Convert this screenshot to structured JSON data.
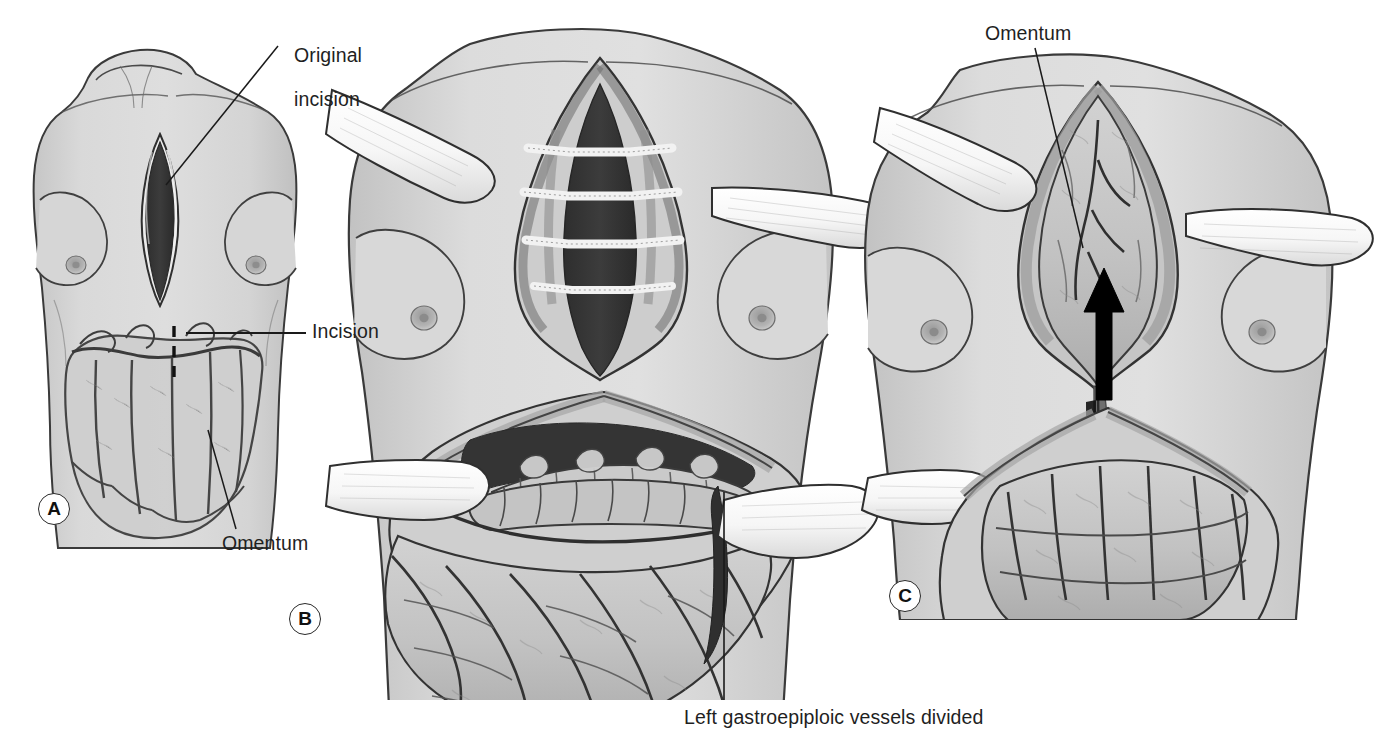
{
  "figure": {
    "title_hidden": "",
    "style": "grayscale medical line-and-wash illustration",
    "background_color": "#ffffff",
    "ink_color": "#2a2a2a",
    "skin_fill": "#d8d8d8",
    "skin_shadow": "#bdbdbd",
    "wound_dark": "#3a3a3a",
    "wound_darkest": "#2f2f2f",
    "tissue_fill": "#c9c9c9",
    "tissue_mid": "#b5b5b5",
    "retractor_fill": "#fbfbfb",
    "retractor_edge": "#3a3a3a",
    "arrow_color": "#000000"
  },
  "panels": [
    {
      "id": "A",
      "marker": "A",
      "marker_pos": {
        "x": 38,
        "y": 493
      },
      "description": "Frontal female torso with median sternotomy incision open; ghosted omentum overlaid on the upper abdomen; dashed vertical line marks planned incision."
    },
    {
      "id": "B",
      "marker": "B",
      "marker_pos": {
        "x": 289,
        "y": 603
      },
      "description": "Torso with sternal wound retracted showing sternal wires, and upper abdomen opened with retractors exposing transverse colon, stomach and omentum."
    },
    {
      "id": "C",
      "marker": "C",
      "marker_pos": {
        "x": 889,
        "y": 580
      },
      "description": "Omentum passed through a substernal tunnel into the sternal wound; black arrow indicates direction of transposition."
    }
  ],
  "labels": [
    {
      "key": "original_incision",
      "text": "Original\nincision",
      "text_lines": [
        "Original",
        "incision"
      ],
      "pos": {
        "x": 283,
        "y": 26
      },
      "leader": {
        "x1": 278,
        "y1": 46,
        "x2": 166,
        "y2": 185
      },
      "panel": "A"
    },
    {
      "key": "incision",
      "text": "Incision",
      "text_lines": [
        "Incision"
      ],
      "pos": {
        "x": 312,
        "y": 322
      },
      "leader": {
        "x1": 306,
        "y1": 333,
        "x2": 186,
        "y2": 333
      },
      "panel": "A"
    },
    {
      "key": "omentum_a",
      "text": "Omentum",
      "text_lines": [
        "Omentum"
      ],
      "pos": {
        "x": 222,
        "y": 534
      },
      "leader": {
        "x1": 236,
        "y1": 529,
        "x2": 208,
        "y2": 430
      },
      "panel": "A"
    },
    {
      "key": "left_gastroepiploic",
      "text": "Left gastroepiploic vessels divided",
      "text_lines": [
        "Left gastroepiploic vessels divided"
      ],
      "pos": {
        "x": 684,
        "y": 709
      },
      "leader": {
        "x1": 724,
        "y1": 703,
        "x2": 724,
        "y2": 492
      },
      "panel": "B"
    },
    {
      "key": "omentum_c",
      "text": "Omentum",
      "text_lines": [
        "Omentum"
      ],
      "pos": {
        "x": 985,
        "y": 26
      },
      "leader": {
        "x1": 1035,
        "y1": 48,
        "x2": 1083,
        "y2": 248
      },
      "panel": "C"
    }
  ],
  "markers": {
    "a": "A",
    "b": "B",
    "c": "C"
  }
}
